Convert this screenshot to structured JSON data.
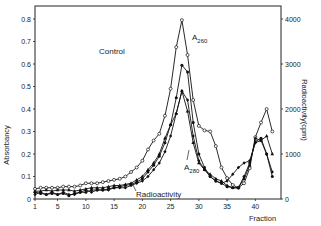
{
  "chart_data": {
    "type": "line",
    "title": "",
    "xlabel": "Fraction",
    "ylabel": "Absorbancy",
    "ylabel_right": "Radioactivity(cpm)",
    "xlim": [
      1,
      44.5
    ],
    "ylim": [
      0,
      0.85
    ],
    "ylim_right": [
      0,
      4250
    ],
    "x_ticks": [
      1,
      5,
      10,
      15,
      20,
      25,
      30,
      35,
      40
    ],
    "y_ticks": [
      "0",
      "0.1",
      "0.2",
      "0.3",
      "0.4",
      "0.5",
      "0.6",
      "0.7",
      "0.8"
    ],
    "y_ticks_right": [
      "0",
      "1000",
      "2000",
      "3000",
      "4000"
    ],
    "grid": false,
    "annotations": [
      {
        "text": "Control",
        "x": 20,
        "y": 0.6
      },
      {
        "text": "A",
        "sub": "260",
        "x": 29,
        "y": 0.7
      },
      {
        "text": "A",
        "sub": "280",
        "x": 30,
        "y": 0.15
      },
      {
        "text": "Radioactivity",
        "x": 19.5,
        "y": 0.03
      }
    ],
    "x": [
      1,
      2,
      3,
      4,
      5,
      6,
      7,
      8,
      9,
      10,
      11,
      12,
      13,
      14,
      15,
      16,
      17,
      18,
      19,
      20,
      21,
      22,
      23,
      24,
      25,
      26,
      27,
      28,
      29,
      30,
      31,
      32,
      33,
      34,
      35,
      36,
      37,
      38,
      39,
      40,
      41,
      42,
      43
    ],
    "series": [
      {
        "name": "A260 (open circles)",
        "marker": "open-circle",
        "values": [
          0.045,
          0.05,
          0.05,
          0.05,
          0.05,
          0.055,
          0.055,
          0.055,
          0.06,
          0.07,
          0.07,
          0.07,
          0.075,
          0.08,
          0.085,
          0.09,
          0.1,
          0.12,
          0.14,
          0.17,
          0.22,
          0.26,
          0.29,
          0.37,
          0.49,
          0.675,
          0.795,
          0.64,
          0.44,
          0.325,
          0.305,
          0.3,
          0.235,
          0.14,
          0.093,
          0.062,
          0.05,
          0.07,
          0.137,
          0.275,
          0.34,
          0.4,
          0.3
        ]
      },
      {
        "name": "A280 (filled circles)",
        "marker": "filled-circle",
        "values": [
          0.03,
          0.025,
          0.02,
          0.025,
          0.02,
          0.025,
          0.015,
          0.025,
          0.03,
          0.03,
          0.04,
          0.04,
          0.04,
          0.045,
          0.05,
          0.055,
          0.06,
          0.065,
          0.075,
          0.09,
          0.12,
          0.15,
          0.19,
          0.25,
          0.33,
          0.45,
          0.595,
          0.565,
          0.34,
          0.2,
          0.14,
          0.1,
          0.08,
          0.07,
          0.055,
          0.05,
          0.05,
          0.1,
          0.16,
          0.255,
          0.27,
          0.2,
          0.1
        ]
      },
      {
        "name": "Treated A260 (filled triangles)",
        "marker": "filled-triangle",
        "values": [
          0.035,
          0.035,
          0.04,
          0.035,
          0.04,
          0.04,
          0.04,
          0.035,
          0.04,
          0.045,
          0.05,
          0.05,
          0.05,
          0.055,
          0.06,
          0.06,
          0.065,
          0.07,
          0.085,
          0.1,
          0.13,
          0.16,
          0.2,
          0.27,
          0.33,
          0.38,
          0.48,
          0.39,
          0.25,
          0.16,
          0.13,
          0.11,
          0.09,
          0.08,
          0.06,
          0.05,
          0.05,
          0.09,
          0.15,
          0.27,
          0.26,
          0.28,
          0.2
        ]
      },
      {
        "name": "Radioactivity (cpm)",
        "marker": "filled-diamond",
        "axis": "right",
        "values_cpm": [
          100,
          150,
          100,
          150,
          100,
          150,
          100,
          100,
          150,
          200,
          150,
          200,
          200,
          200,
          250,
          250,
          250,
          300,
          350,
          400,
          500,
          650,
          800,
          1050,
          1400,
          1900,
          2400,
          2200,
          1400,
          850,
          650,
          500,
          400,
          350,
          400,
          550,
          700,
          800,
          850,
          1250,
          1300,
          1000,
          600
        ]
      }
    ]
  },
  "labels": {
    "y_left": "Absorbancy",
    "y_right": "Radioactivity(cpm)",
    "x": "Fraction",
    "control": "Control",
    "a260_main": "A",
    "a260_sub": "260",
    "a280_main": "A",
    "a280_sub": "280",
    "radioactivity": "Radioactivity"
  }
}
